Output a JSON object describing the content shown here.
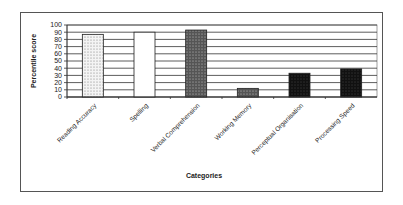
{
  "chart_data": {
    "type": "bar",
    "title": "",
    "xlabel": "Categories",
    "ylabel": "Percentile score",
    "ylim": [
      0,
      100
    ],
    "yticks": [
      0,
      10,
      20,
      30,
      40,
      50,
      60,
      70,
      80,
      90,
      100
    ],
    "grid": true,
    "legend": null,
    "categories": [
      "Reading Accuracy",
      "Spelling",
      "Verbal Comprehension",
      "Working Memory",
      "Perceptual Organisation",
      "Processing Speed"
    ],
    "values": [
      87,
      90,
      93,
      12,
      33,
      39
    ],
    "bar_fills": [
      "light-dots",
      "white",
      "dark-dots",
      "dark-dots",
      "black-dots",
      "black-dots"
    ]
  }
}
